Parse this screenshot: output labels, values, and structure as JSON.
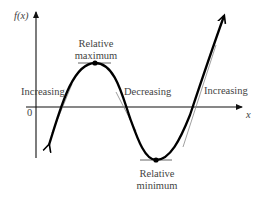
{
  "diagram": {
    "y_axis_label": "f(x)",
    "x_axis_label": "x",
    "origin_label": "0",
    "annotations": {
      "relative_max_line1": "Relative",
      "relative_max_line2": "maximum",
      "relative_min_line1": "Relative",
      "relative_min_line2": "minimum",
      "increasing_left": "Increasing",
      "decreasing": "Decreasing",
      "increasing_right": "Increasing"
    },
    "colors": {
      "curve": "#000000",
      "axes": "#111111",
      "tangent": "#555555",
      "text": "#444444"
    }
  }
}
